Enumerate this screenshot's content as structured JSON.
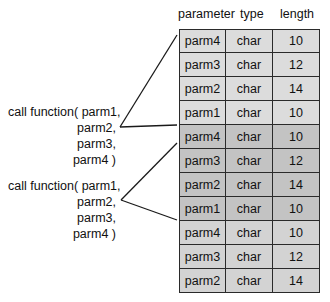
{
  "headers": {
    "parameter": "parameter",
    "type": "type",
    "length": "length"
  },
  "table": {
    "rows": [
      {
        "parameter": "parm4",
        "type": "char",
        "length": "10",
        "shade": "light"
      },
      {
        "parameter": "parm3",
        "type": "char",
        "length": "12",
        "shade": "light"
      },
      {
        "parameter": "parm2",
        "type": "char",
        "length": "14",
        "shade": "light"
      },
      {
        "parameter": "parm1",
        "type": "char",
        "length": "10",
        "shade": "light"
      },
      {
        "parameter": "parm4",
        "type": "char",
        "length": "10",
        "shade": "dark"
      },
      {
        "parameter": "parm3",
        "type": "char",
        "length": "12",
        "shade": "dark"
      },
      {
        "parameter": "parm2",
        "type": "char",
        "length": "14",
        "shade": "dark"
      },
      {
        "parameter": "parm1",
        "type": "char",
        "length": "10",
        "shade": "dark"
      },
      {
        "parameter": "parm4",
        "type": "char",
        "length": "10",
        "shade": "mid"
      },
      {
        "parameter": "parm3",
        "type": "char",
        "length": "12",
        "shade": "mid"
      },
      {
        "parameter": "parm2",
        "type": "char",
        "length": "14",
        "shade": "mid"
      }
    ]
  },
  "calls": [
    {
      "lines": [
        "call function( parm1,",
        "parm2,",
        "parm3,",
        "parm4 )"
      ]
    },
    {
      "lines": [
        "call function( parm1,",
        "parm2,",
        "parm3,",
        "parm4 )"
      ]
    }
  ],
  "colors": {
    "shade_light": "#dcdcdc",
    "shade_dark": "#c3c3c3",
    "shade_mid": "#d3d3d3",
    "line": "#1a1a1a"
  }
}
